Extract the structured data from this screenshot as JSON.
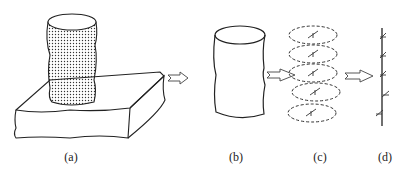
{
  "panels": [
    {
      "id": "a",
      "label": "(a)",
      "description": "Stippled cylinder standing on a rough block"
    },
    {
      "id": "b",
      "label": "(b)",
      "description": "Extracted cylinder outline"
    },
    {
      "id": "c",
      "label": "(c)",
      "description": "Cylinder sliced into dashed elliptical layers with small marks"
    },
    {
      "id": "d",
      "label": "(d)",
      "description": "Vertical axis with small marks at each slice"
    }
  ],
  "arrows": [
    {
      "from": "a",
      "to": "b"
    },
    {
      "from": "b",
      "to": "c"
    },
    {
      "from": "c",
      "to": "d"
    }
  ],
  "colors": {
    "stroke": "#222222",
    "background": "#ffffff",
    "stipple": "#333333"
  }
}
